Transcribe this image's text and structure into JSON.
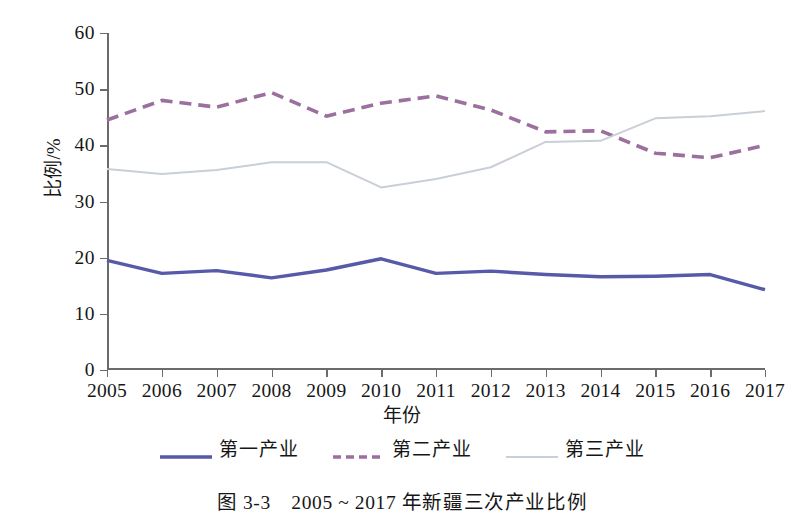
{
  "chart_data": {
    "type": "line",
    "title": "",
    "xlabel": "年份",
    "ylabel": "比例/%",
    "categories": [
      "2005",
      "2006",
      "2007",
      "2008",
      "2009",
      "2010",
      "2011",
      "2012",
      "2013",
      "2014",
      "2015",
      "2016",
      "2017"
    ],
    "x": [
      2005,
      2006,
      2007,
      2008,
      2009,
      2010,
      2011,
      2012,
      2013,
      2014,
      2015,
      2016,
      2017
    ],
    "ylim": [
      0,
      60
    ],
    "yticks": [
      0,
      10,
      20,
      30,
      40,
      50,
      60
    ],
    "grid": false,
    "legend_position": "bottom",
    "series": [
      {
        "name": "第一产业",
        "style": "solid",
        "color": "#565aa8",
        "values": [
          19.5,
          17.2,
          17.7,
          16.4,
          17.8,
          19.8,
          17.2,
          17.6,
          17.0,
          16.6,
          16.7,
          17.0,
          14.3
        ]
      },
      {
        "name": "第二产业",
        "style": "dashed",
        "color": "#9b6f9e",
        "values": [
          44.5,
          48.0,
          46.8,
          49.4,
          45.2,
          47.5,
          48.8,
          46.3,
          42.4,
          42.6,
          38.6,
          37.8,
          40.0
        ]
      },
      {
        "name": "第三产业",
        "style": "solid",
        "color": "#c9cfd6",
        "values": [
          35.8,
          34.9,
          35.6,
          37.0,
          37.0,
          32.5,
          34.0,
          36.1,
          40.6,
          40.8,
          44.8,
          45.2,
          46.1
        ]
      }
    ]
  },
  "figure": {
    "caption": "图 3-3　2005 ~ 2017 年新疆三次产业比例"
  },
  "colors": {
    "axis": "#6b6b6b",
    "text": "#161616",
    "series_primary": "#565aa8",
    "series_secondary": "#9b6f9e",
    "series_tertiary": "#c9cfd6",
    "background": "#ffffff"
  }
}
